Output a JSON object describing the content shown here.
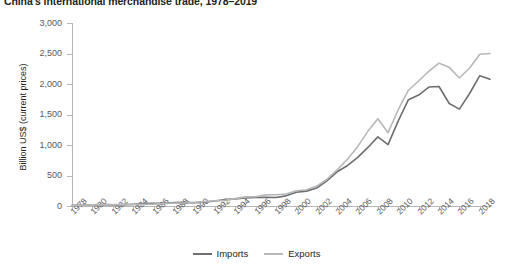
{
  "chart_data": {
    "type": "line",
    "title": "China's international merchandise trade, 1978–2019",
    "xlabel": "",
    "ylabel": "Billion US$ (current prices)",
    "ylim": [
      0,
      3000
    ],
    "xlim": [
      1978,
      2019
    ],
    "grid": false,
    "legend_position": "bottom-center",
    "ytick_labels": [
      "0",
      "500",
      "1,000",
      "1,500",
      "2,000",
      "2,500",
      "3,000"
    ],
    "ytick_values": [
      0,
      500,
      1000,
      1500,
      2000,
      2500,
      3000
    ],
    "xtick_labels": [
      "1978",
      "1980",
      "1982",
      "1984",
      "1986",
      "1988",
      "1990",
      "1992",
      "1994",
      "1996",
      "1998",
      "2000",
      "2002",
      "2004",
      "2006",
      "2008",
      "2010",
      "2012",
      "2014",
      "2016",
      "2018"
    ],
    "xtick_values": [
      1978,
      1980,
      1982,
      1984,
      1986,
      1988,
      1990,
      1992,
      1994,
      1996,
      1998,
      2000,
      2002,
      2004,
      2006,
      2008,
      2010,
      2012,
      2014,
      2016,
      2018
    ],
    "x": [
      1978,
      1979,
      1980,
      1981,
      1982,
      1983,
      1984,
      1985,
      1986,
      1987,
      1988,
      1989,
      1990,
      1991,
      1992,
      1993,
      1994,
      1995,
      1996,
      1997,
      1998,
      1999,
      2000,
      2001,
      2002,
      2003,
      2004,
      2005,
      2006,
      2007,
      2008,
      2009,
      2010,
      2011,
      2012,
      2013,
      2014,
      2015,
      2016,
      2017,
      2018,
      2019
    ],
    "series": [
      {
        "name": "Imports",
        "color": "#6d6e71",
        "values": [
          11,
          16,
          20,
          22,
          19,
          21,
          27,
          42,
          43,
          43,
          55,
          59,
          53,
          64,
          81,
          104,
          116,
          132,
          139,
          142,
          140,
          166,
          225,
          244,
          295,
          413,
          561,
          660,
          792,
          956,
          1133,
          1006,
          1396,
          1743,
          1818,
          1950,
          1959,
          1680,
          1588,
          1844,
          2136,
          2077
        ]
      },
      {
        "name": "Exports",
        "color": "#b6b8ba",
        "values": [
          10,
          14,
          18,
          22,
          22,
          22,
          26,
          27,
          31,
          39,
          48,
          53,
          62,
          72,
          85,
          92,
          121,
          149,
          151,
          183,
          184,
          195,
          249,
          266,
          326,
          438,
          593,
          762,
          969,
          1220,
          1431,
          1202,
          1578,
          1898,
          2049,
          2209,
          2342,
          2273,
          2098,
          2263,
          2487,
          2499
        ]
      }
    ]
  },
  "legend": {
    "items": [
      {
        "label": "Imports",
        "color": "#6d6e71"
      },
      {
        "label": "Exports",
        "color": "#b6b8ba"
      }
    ]
  }
}
